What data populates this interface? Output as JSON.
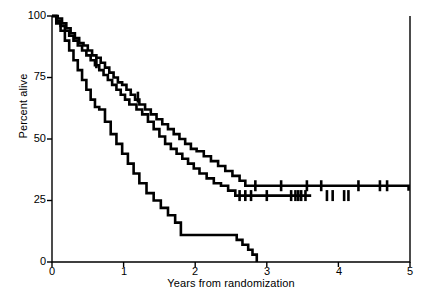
{
  "chart_data": {
    "type": "line",
    "title": "",
    "xlabel": "Years from randomization",
    "ylabel": "Percent alive",
    "xlim": [
      0,
      5
    ],
    "ylim": [
      0,
      100
    ],
    "xticks": [
      0,
      1,
      2,
      3,
      4,
      5
    ],
    "yticks": [
      0,
      25,
      50,
      75,
      100
    ],
    "grid": false,
    "legend": "none",
    "plot_style": "kaplan-meier step curves with censoring tick marks",
    "series": [
      {
        "name": "curve-upper",
        "step": "post",
        "plateau_value": 31,
        "x": [
          0.0,
          0.08,
          0.14,
          0.2,
          0.26,
          0.32,
          0.38,
          0.44,
          0.5,
          0.56,
          0.62,
          0.68,
          0.74,
          0.8,
          0.86,
          0.92,
          0.98,
          1.04,
          1.1,
          1.16,
          1.22,
          1.3,
          1.38,
          1.46,
          1.54,
          1.62,
          1.7,
          1.78,
          1.86,
          1.94,
          2.02,
          2.12,
          2.22,
          2.32,
          2.42,
          2.52,
          2.62,
          2.7,
          4.98
        ],
        "y": [
          100,
          99,
          97,
          95,
          93,
          91,
          89,
          88,
          86,
          84,
          83,
          81,
          79,
          77,
          75,
          73,
          72,
          70,
          68,
          66,
          64,
          62,
          60,
          58,
          56,
          54,
          52,
          50,
          48,
          46,
          45,
          43,
          41,
          39,
          37,
          35,
          33,
          31,
          29
        ],
        "censor_x": [
          0.62,
          1.2,
          2.84,
          3.2,
          3.56,
          3.76,
          4.28,
          4.58,
          4.68
        ],
        "censor_y": [
          81,
          67,
          31,
          31,
          31,
          31,
          31,
          31,
          31
        ]
      },
      {
        "name": "curve-middle",
        "step": "post",
        "plateau_value": 27,
        "x": [
          0.0,
          0.06,
          0.12,
          0.18,
          0.24,
          0.3,
          0.36,
          0.42,
          0.48,
          0.54,
          0.6,
          0.66,
          0.72,
          0.78,
          0.84,
          0.9,
          0.96,
          1.02,
          1.08,
          1.18,
          1.26,
          1.34,
          1.42,
          1.5,
          1.58,
          1.66,
          1.74,
          1.82,
          1.9,
          1.98,
          2.06,
          2.16,
          2.26,
          2.36,
          2.46,
          2.56,
          3.62
        ],
        "y": [
          100,
          98,
          96,
          94,
          92,
          90,
          88,
          86,
          84,
          82,
          80,
          78,
          76,
          74,
          72,
          70,
          68,
          66,
          64,
          62,
          60,
          57,
          54,
          51,
          48,
          46,
          44,
          42,
          40,
          38,
          36,
          34,
          32,
          31,
          29,
          27,
          27
        ],
        "censor_x": [
          2.62,
          2.7,
          2.78,
          3.0,
          3.34,
          3.4,
          3.44,
          3.48,
          3.54,
          3.84,
          3.92,
          4.08,
          4.14
        ],
        "censor_y": [
          27,
          27,
          27,
          27,
          27,
          27,
          27,
          27,
          27,
          27,
          27,
          27,
          27
        ]
      },
      {
        "name": "curve-lower",
        "step": "post",
        "plateau_value": 11,
        "x": [
          0.0,
          0.06,
          0.12,
          0.18,
          0.24,
          0.3,
          0.36,
          0.42,
          0.48,
          0.54,
          0.6,
          0.66,
          0.74,
          0.82,
          0.9,
          0.98,
          1.06,
          1.14,
          1.22,
          1.32,
          1.42,
          1.52,
          1.62,
          1.72,
          1.8,
          2.46,
          2.58,
          2.66,
          2.74,
          2.8,
          2.86
        ],
        "y": [
          100,
          97,
          94,
          90,
          86,
          82,
          78,
          74,
          70,
          66,
          63,
          62,
          57,
          52,
          48,
          44,
          40,
          36,
          32,
          28,
          25,
          22,
          19,
          16,
          11,
          11,
          9,
          7,
          5,
          3,
          0
        ],
        "censor_x": [],
        "censor_y": []
      }
    ]
  },
  "axes": {
    "ylabel_text": "Percent alive",
    "xlabel_text": "Years from randomization",
    "ytick_labels": [
      "100",
      "75",
      "50",
      "25",
      "0"
    ],
    "xtick_labels": [
      "0",
      "1",
      "2",
      "3",
      "4",
      "5"
    ]
  },
  "style": {
    "line_color": "#000000",
    "axis_color": "#000000",
    "background": "#ffffff",
    "line_width": 2.6,
    "axis_width": 1.4
  }
}
